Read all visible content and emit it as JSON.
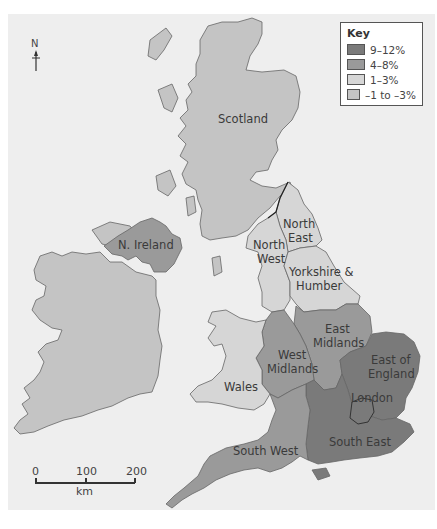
{
  "map": {
    "key": {
      "title": "Key",
      "items": [
        {
          "label": "9–12%",
          "color": "#7a7a7a"
        },
        {
          "label": "4–8%",
          "color": "#9a9a9a"
        },
        {
          "label": "1–3%",
          "color": "#d6d6d6"
        },
        {
          "label": "–1 to –3%",
          "color": "#c4c4c4"
        }
      ]
    },
    "north_arrow": {
      "letter": "N"
    },
    "scale_bar": {
      "ticks": [
        "0",
        "100",
        "200"
      ],
      "unit": "km"
    },
    "regions": [
      {
        "name": "Scotland",
        "label": "Scotland",
        "category": "–1 to –3%"
      },
      {
        "name": "N. Ireland",
        "label": "N. Ireland",
        "category": "4–8%"
      },
      {
        "name": "North East",
        "label": "North East",
        "category": "1–3%"
      },
      {
        "name": "North West",
        "label": "North West",
        "category": "1–3%"
      },
      {
        "name": "Yorkshire & Humber",
        "label": "Yorkshire & Humber",
        "category": "1–3%"
      },
      {
        "name": "East Midlands",
        "label": "East Midlands",
        "category": "4–8%"
      },
      {
        "name": "West Midlands",
        "label": "West Midlands",
        "category": "4–8%"
      },
      {
        "name": "Wales",
        "label": "Wales",
        "category": "1–3%"
      },
      {
        "name": "East of England",
        "label": "East of England",
        "category": "9–12%"
      },
      {
        "name": "London",
        "label": "London",
        "category": "9–12%"
      },
      {
        "name": "South East",
        "label": "South East",
        "category": "9–12%"
      },
      {
        "name": "South West",
        "label": "South West",
        "category": "4–8%"
      },
      {
        "name": "Republic of Ireland",
        "label": "",
        "category": "–1 to –3%"
      }
    ],
    "labels": {
      "scotland": "Scotland",
      "n_ireland": "N. Ireland",
      "north_east_1": "North",
      "north_east_2": "East",
      "north_west_1": "North",
      "north_west_2": "West",
      "yorkshire_1": "Yorkshire &",
      "yorkshire_2": "Humber",
      "east_midlands_1": "East",
      "east_midlands_2": "Midlands",
      "west_midlands_1": "West",
      "west_midlands_2": "Midlands",
      "wales": "Wales",
      "east_of_england_1": "East of",
      "east_of_england_2": "England",
      "london": "London",
      "south_east": "South East",
      "south_west": "South West"
    }
  }
}
